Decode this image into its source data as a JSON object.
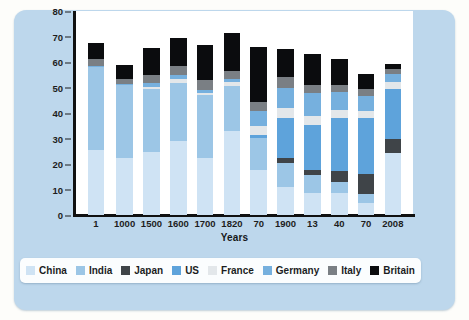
{
  "chart_data": {
    "type": "bar",
    "stacked": true,
    "title": "",
    "xlabel": "Years",
    "ylabel": "",
    "ylim": [
      0,
      80
    ],
    "yticks": [
      0,
      10,
      20,
      30,
      40,
      50,
      60,
      70,
      80
    ],
    "grid": false,
    "legend_position": "bottom",
    "categories": [
      "1",
      "1000",
      "1500",
      "1600",
      "1700",
      "1820",
      "70",
      "1900",
      "13",
      "40",
      "70",
      "2008"
    ],
    "series": [
      {
        "name": "China",
        "color": "#cfe3f4",
        "values": [
          25.5,
          22.5,
          24.8,
          29.0,
          22.5,
          33.0,
          17.8,
          11.0,
          8.8,
          8.6,
          4.6,
          24.5
        ]
      },
      {
        "name": "India",
        "color": "#9cc6e6",
        "values": [
          32.5,
          28.5,
          24.8,
          22.8,
          24.5,
          17.5,
          12.5,
          9.5,
          7.0,
          4.5,
          3.5,
          0.0
        ]
      },
      {
        "name": "Japan",
        "color": "#3f4448",
        "values": [
          0.0,
          0.0,
          0.0,
          0.0,
          0.0,
          0.0,
          0.0,
          2.0,
          2.0,
          4.0,
          8.0,
          5.5
        ]
      },
      {
        "name": "US",
        "color": "#5ea3db",
        "values": [
          0.0,
          0.0,
          0.0,
          0.0,
          0.0,
          0.0,
          1.0,
          15.5,
          17.5,
          21.0,
          22.0,
          19.5
        ]
      },
      {
        "name": "France",
        "color": "#e3e7ea",
        "values": [
          0.0,
          0.0,
          0.5,
          1.5,
          1.0,
          1.5,
          3.5,
          4.0,
          3.5,
          3.0,
          2.5,
          2.8
        ]
      },
      {
        "name": "Germany",
        "color": "#76b0de",
        "values": [
          0.5,
          0.5,
          1.5,
          1.5,
          1.0,
          1.5,
          6.0,
          8.0,
          9.0,
          7.0,
          6.0,
          3.0
        ]
      },
      {
        "name": "Italy",
        "color": "#7a7f84",
        "values": [
          2.5,
          2.0,
          3.5,
          3.5,
          4.0,
          3.0,
          3.5,
          4.0,
          3.0,
          3.0,
          2.8,
          2.0
        ]
      },
      {
        "name": "Britain",
        "color": "#0b0c0e",
        "values": [
          6.5,
          5.5,
          10.5,
          11.0,
          13.5,
          15.0,
          21.5,
          11.0,
          12.5,
          10.0,
          6.0,
          2.0
        ]
      }
    ]
  },
  "axis": {
    "x_title": "Years"
  },
  "legend": {
    "items": [
      {
        "label": "China"
      },
      {
        "label": "India"
      },
      {
        "label": "Japan"
      },
      {
        "label": "US"
      },
      {
        "label": "France"
      },
      {
        "label": "Germany"
      },
      {
        "label": "Italy"
      },
      {
        "label": "Britain"
      }
    ]
  }
}
